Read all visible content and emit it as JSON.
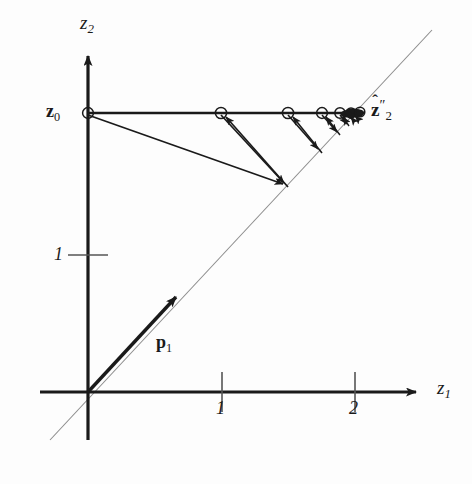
{
  "figure": {
    "type": "diagram",
    "background_color": "#fdfdfd",
    "ink_color": "#1a1a1a",
    "guide_color": "#8c8c8c"
  },
  "axes": {
    "origin_px": [
      88,
      392
    ],
    "x_axis": {
      "label": "z",
      "label_sub": "1",
      "arrow_tip_px": [
        427,
        392
      ],
      "ticks": [
        {
          "value": "1",
          "x_px": 222
        },
        {
          "value": "2",
          "x_px": 355
        }
      ]
    },
    "y_axis": {
      "label": "z",
      "label_sub": "2",
      "arrow_tip_px": [
        88,
        48
      ],
      "ticks": [
        {
          "value": "1",
          "y_px": 255
        }
      ]
    },
    "units": {
      "px_per_unit_x": 133.5,
      "px_per_unit_y": 137
    }
  },
  "guide_line": {
    "name": "diagonal-subspace-line",
    "from_px": [
      50,
      440
    ],
    "to_px": [
      432,
      30
    ],
    "slope_note": "45 degree line through the origin",
    "stroke": "#8c8c8c"
  },
  "vectors": {
    "p1": {
      "label": "p",
      "label_sub": "1",
      "from_px": [
        88,
        392
      ],
      "to_px": [
        179,
        294
      ],
      "label_px": [
        156,
        332
      ]
    }
  },
  "points": {
    "z0": {
      "label": "z",
      "label_sub": "0",
      "px": [
        88,
        113
      ],
      "marker": "open-circle",
      "label_px": [
        46,
        101
      ]
    },
    "z_hat_limit": {
      "label": "z",
      "label_sup": "″",
      "label_sub": "2",
      "accent": "hat",
      "px": [
        358,
        113
      ],
      "label_px": [
        371,
        97
      ]
    }
  },
  "iteration": {
    "horizontal_line_y_px": 113,
    "horizontal_nodes_px": [
      88,
      221,
      288,
      322,
      340,
      349,
      354,
      357
    ],
    "diagonal_nodes_px": [
      [
        288,
        187
      ],
      [
        322,
        153
      ],
      [
        340,
        135
      ],
      [
        349,
        126
      ],
      [
        354,
        121
      ],
      [
        357,
        118
      ]
    ],
    "open_circle_nodes_px": [
      88,
      221,
      288,
      322,
      340,
      350,
      356
    ],
    "arrow_count": 12,
    "note": "Arrows alternate: from a horizontal node down-right onto the diagonal line, then back up-left onto the horizontal line, converging to the limit point."
  },
  "labels": {
    "z2_axis": "z",
    "z1_axis": "z",
    "z0": "z",
    "p1": "p",
    "tick_x1": "1",
    "tick_x2": "2",
    "tick_y1": "1",
    "zhat": "z",
    "sub_0": "0",
    "sub_1": "1",
    "sub_2": "2",
    "dprime": "″",
    "hat": "ˆ"
  }
}
